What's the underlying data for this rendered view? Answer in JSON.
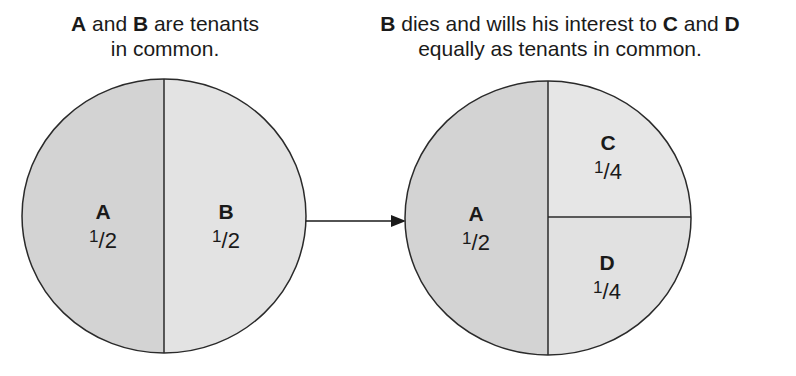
{
  "captions": {
    "left": {
      "party1": "A",
      "text1": " and ",
      "party2": "B",
      "text2": " are tenants",
      "line2": "in common."
    },
    "right": {
      "party1": "B",
      "text1": " dies and wills his interest to ",
      "party2": "C",
      "text2": " and ",
      "party3": "D",
      "line2": "equally as tenants in common."
    }
  },
  "before": {
    "shares": [
      {
        "owner": "A",
        "numerator": "1",
        "denominator": "2"
      },
      {
        "owner": "B",
        "numerator": "1",
        "denominator": "2"
      }
    ]
  },
  "after": {
    "shares": [
      {
        "owner": "A",
        "numerator": "1",
        "denominator": "2"
      },
      {
        "owner": "C",
        "numerator": "1",
        "denominator": "4"
      },
      {
        "owner": "D",
        "numerator": "1",
        "denominator": "4"
      }
    ]
  },
  "colors": {
    "fill_dark": "#d3d3d3",
    "fill_light": "#e3e3e3",
    "stroke": "#2a2a2a"
  }
}
